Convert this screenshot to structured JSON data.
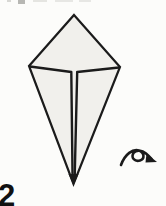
{
  "figure": {
    "step_number": "2",
    "shape": "kite-base",
    "fill_color": "#f1f0ec",
    "stroke_color": "#1b1b1b",
    "turn_over_icon": "turn-over-arrow"
  }
}
